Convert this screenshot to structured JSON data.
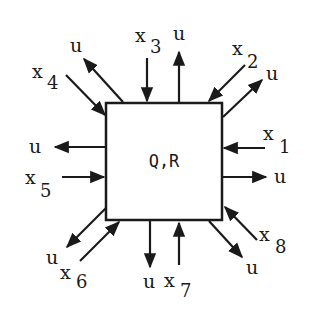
{
  "diagram": {
    "node_label": "Q,R",
    "inputs": [
      {
        "var": "x",
        "sub": "1"
      },
      {
        "var": "x",
        "sub": "2"
      },
      {
        "var": "x",
        "sub": "3"
      },
      {
        "var": "x",
        "sub": "4"
      },
      {
        "var": "x",
        "sub": "5"
      },
      {
        "var": "x",
        "sub": "6"
      },
      {
        "var": "x",
        "sub": "7"
      },
      {
        "var": "x",
        "sub": "8"
      }
    ],
    "output_label": "u",
    "outputs": [
      "u",
      "u",
      "u",
      "u",
      "u",
      "u",
      "u",
      "u"
    ],
    "colors": {
      "stroke": "#1a1a1a",
      "background": "#ffffff"
    }
  }
}
